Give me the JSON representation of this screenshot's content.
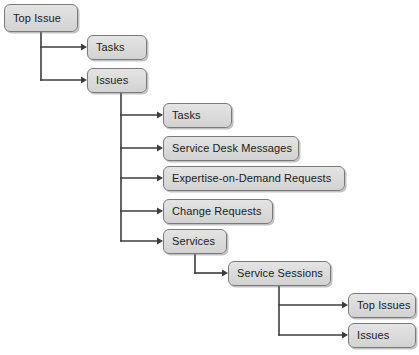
{
  "diagram": {
    "type": "tree",
    "colors": {
      "node_fill": "#dcdcdc",
      "node_border": "#7a7a7a",
      "node_shadow": "#b4b4b4",
      "connector": "#3c3c3c",
      "background": "#ffffff",
      "text": "#1b1b1b"
    },
    "nodes": [
      {
        "id": "top-issue",
        "label": "Top Issue",
        "level": 0,
        "x": 4,
        "y": 4,
        "w": 74,
        "h": 28
      },
      {
        "id": "tasks-l1",
        "label": "Tasks",
        "level": 1,
        "x": 87,
        "y": 35,
        "w": 60,
        "h": 25
      },
      {
        "id": "issues-l1",
        "label": "Issues",
        "level": 1,
        "x": 87,
        "y": 68,
        "w": 60,
        "h": 25
      },
      {
        "id": "tasks-l2",
        "label": "Tasks",
        "level": 2,
        "x": 163,
        "y": 103,
        "w": 69,
        "h": 25
      },
      {
        "id": "service-desk-messages",
        "label": "Service Desk Messages",
        "level": 2,
        "x": 163,
        "y": 136,
        "w": 136,
        "h": 25
      },
      {
        "id": "expertise-on-demand-requests",
        "label": "Expertise-on-Demand Requests",
        "level": 2,
        "x": 163,
        "y": 166,
        "w": 182,
        "h": 25
      },
      {
        "id": "change-requests",
        "label": "Change Requests",
        "level": 2,
        "x": 163,
        "y": 199,
        "w": 110,
        "h": 25
      },
      {
        "id": "services",
        "label": "Services",
        "level": 2,
        "x": 163,
        "y": 229,
        "w": 64,
        "h": 25
      },
      {
        "id": "service-sessions",
        "label": "Service Sessions",
        "level": 3,
        "x": 228,
        "y": 261,
        "w": 103,
        "h": 25
      },
      {
        "id": "top-issues-l4",
        "label": "Top Issues",
        "level": 4,
        "x": 348,
        "y": 293,
        "w": 68,
        "h": 25
      },
      {
        "id": "issues-l4",
        "label": "Issues",
        "level": 4,
        "x": 348,
        "y": 323,
        "w": 68,
        "h": 25
      }
    ],
    "edges": [
      {
        "from": "top-issue",
        "to": "tasks-l1"
      },
      {
        "from": "top-issue",
        "to": "issues-l1"
      },
      {
        "from": "issues-l1",
        "to": "tasks-l2"
      },
      {
        "from": "issues-l1",
        "to": "service-desk-messages"
      },
      {
        "from": "issues-l1",
        "to": "expertise-on-demand-requests"
      },
      {
        "from": "issues-l1",
        "to": "change-requests"
      },
      {
        "from": "issues-l1",
        "to": "services"
      },
      {
        "from": "services",
        "to": "service-sessions"
      },
      {
        "from": "service-sessions",
        "to": "top-issues-l4"
      },
      {
        "from": "service-sessions",
        "to": "issues-l4"
      }
    ],
    "connector_paths": [
      "M41,32 L41,80",
      "M41,47 L82,47",
      "M41,80 L82,80",
      "M121,93 L121,241",
      "M121,115 L158,115",
      "M121,148 L158,148",
      "M121,178 L158,178",
      "M121,211 L158,211",
      "M121,241 L158,241",
      "M195,254 L195,273",
      "M195,273 L223,273",
      "M279,286 L279,335",
      "M279,305 L343,305",
      "M279,335 L343,335"
    ],
    "arrow_heads": [
      {
        "x": 87,
        "y": 47
      },
      {
        "x": 87,
        "y": 80
      },
      {
        "x": 163,
        "y": 115
      },
      {
        "x": 163,
        "y": 148
      },
      {
        "x": 163,
        "y": 178
      },
      {
        "x": 163,
        "y": 211
      },
      {
        "x": 163,
        "y": 241
      },
      {
        "x": 228,
        "y": 273
      },
      {
        "x": 348,
        "y": 305
      },
      {
        "x": 348,
        "y": 335
      }
    ]
  }
}
